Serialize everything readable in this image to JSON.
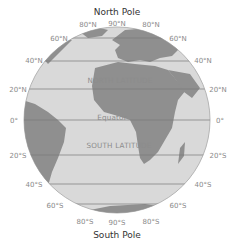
{
  "title_top": "North Pole",
  "title_bottom": "South Pole",
  "regions": {
    "north": "NORTH LATITUDE",
    "equator": "Equator",
    "south": "SOUTH LATITUDE"
  },
  "labels": {
    "n90": "90°N",
    "n80_left": "80°N",
    "n80_right": "80°N",
    "n60_left": "60°N",
    "n60_right": "60°N",
    "n40_left": "40°N",
    "n40_right": "40°N",
    "n20_left": "20°N",
    "n20_right": "20°N",
    "eq_left": "0°",
    "eq_right": "0°",
    "s20_left": "20°S",
    "s20_right": "20°S",
    "s40_left": "40°S",
    "s40_right": "40°S",
    "s60_left": "60°S",
    "s60_right": "60°S",
    "s80_left": "80°S",
    "s80_right": "80°S",
    "s90": "90°S"
  },
  "colors": {
    "ocean": "#d9d9d9",
    "land": "#8f8f8f",
    "lines": "#7a7a7a"
  }
}
